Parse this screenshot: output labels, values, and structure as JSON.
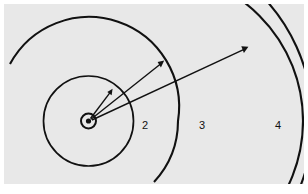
{
  "figure": {
    "panel_background": "#e8e8e8",
    "outer_background": "#ffffff",
    "line_color": "#111111",
    "width": 308,
    "height": 194
  },
  "nucleus": {
    "name": "nucleus",
    "cx": 84.5,
    "cy": 117,
    "ring_radius": 7.5,
    "dot_radius": 2.6
  },
  "shells": [
    {
      "label": "",
      "index": 1,
      "radius": 45,
      "label_x": null,
      "label_y": null
    },
    {
      "label": "2",
      "index": 2,
      "radius": 90,
      "label_x": 141,
      "label_y": 121
    },
    {
      "label": "3",
      "index": 3,
      "radius": 101,
      "label_x": 198,
      "label_y": 121
    },
    {
      "label": "4",
      "index": 4,
      "radius": 180,
      "label_x": 274,
      "label_y": 121
    }
  ],
  "transitions": [
    {
      "name": "transition-to-shell-1",
      "from_x": 84.5,
      "from_y": 117,
      "to_x": 108,
      "to_y": 86,
      "target_shell": 1
    },
    {
      "name": "transition-to-shell-2",
      "from_x": 84.5,
      "from_y": 117,
      "to_x": 159,
      "to_y": 57,
      "target_shell": 2
    },
    {
      "name": "transition-to-shell-3",
      "from_x": 84.5,
      "from_y": 117,
      "to_x": 243,
      "to_y": 43,
      "target_shell": 3
    }
  ]
}
